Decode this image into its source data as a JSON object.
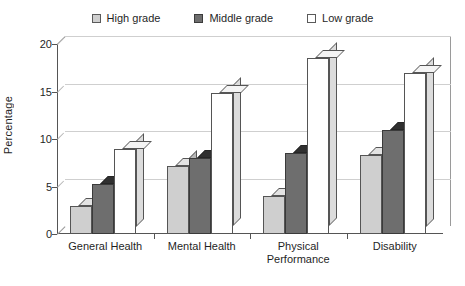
{
  "chart_data": {
    "type": "bar",
    "title": "",
    "xlabel": "",
    "ylabel": "Percentage",
    "ylim": [
      0,
      20
    ],
    "yticks": [
      0,
      5,
      10,
      15,
      20
    ],
    "grid": true,
    "legend_position": "top",
    "categories": [
      "General Health",
      "Mental Health",
      "Physical Performance",
      "Disability"
    ],
    "category_lines": [
      [
        "General Health"
      ],
      [
        "Mental Health"
      ],
      [
        "Physical",
        "Performance"
      ],
      [
        "Disability"
      ]
    ],
    "series": [
      {
        "name": "High grade",
        "color": "#cfcfcf",
        "values": [
          3.0,
          7.2,
          4.0,
          8.3
        ]
      },
      {
        "name": "Middle grade",
        "color": "#6e6e6e",
        "values": [
          5.3,
          8.0,
          8.5,
          11.0
        ]
      },
      {
        "name": "Low grade",
        "color": "#ffffff",
        "values": [
          9.0,
          14.8,
          18.5,
          17.0
        ]
      }
    ]
  },
  "legend": {
    "items": [
      {
        "label": "High grade"
      },
      {
        "label": "Middle grade"
      },
      {
        "label": "Low grade"
      }
    ]
  },
  "axes": {
    "y_title": "Percentage",
    "y_tick_labels": [
      "20",
      "15",
      "10",
      "5",
      "0"
    ]
  }
}
